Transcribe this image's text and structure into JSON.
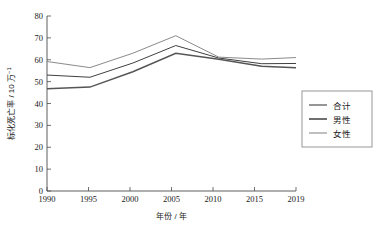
{
  "chart_data": {
    "type": "line",
    "title": "",
    "xlabel": "年份 / 年",
    "ylabel": "标化死亡率 / 10 万⁻¹",
    "x": [
      1990,
      1995,
      2000,
      2005,
      2010,
      2015,
      2019
    ],
    "xtick_labels": [
      "1990",
      "1995",
      "2000",
      "2005",
      "2010",
      "2015",
      "2019"
    ],
    "ytick_labels": [
      "0",
      "10",
      "20",
      "30",
      "40",
      "50",
      "60",
      "70",
      "80"
    ],
    "yticks": [
      0,
      10,
      20,
      30,
      40,
      50,
      60,
      70,
      80
    ],
    "xlim": [
      1990,
      2019
    ],
    "ylim": [
      0,
      80
    ],
    "grid": false,
    "legend_position": "right-outside",
    "series": [
      {
        "name": "合计",
        "color": "#404040",
        "width": 1.0,
        "values": [
          53.0,
          52.0,
          58.5,
          66.5,
          60.8,
          58.2,
          58.3
        ]
      },
      {
        "name": "男性",
        "color": "#555555",
        "width": 1.5,
        "values": [
          46.8,
          47.5,
          54.5,
          63.0,
          60.2,
          57.0,
          56.3
        ]
      },
      {
        "name": "女性",
        "color": "#8a8a8a",
        "width": 1.0,
        "values": [
          59.2,
          56.4,
          63.0,
          71.0,
          61.2,
          60.3,
          61.0
        ]
      }
    ]
  },
  "legend": {
    "entries": [
      "合计",
      "男性",
      "女性"
    ]
  },
  "axes": {
    "x_title": "年份 / 年",
    "y_title_main": "标化死亡率 / 10 万",
    "y_title_sup": "−1"
  }
}
